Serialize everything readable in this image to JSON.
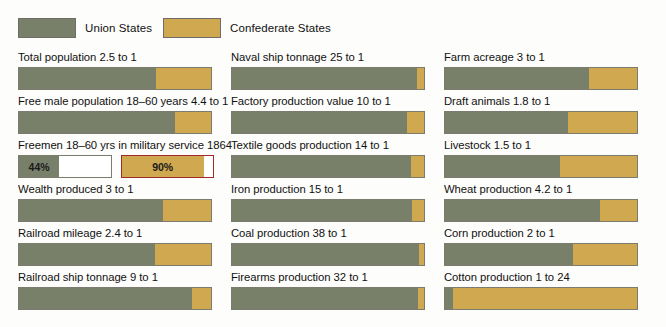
{
  "legend": {
    "union": {
      "label": "Union States",
      "color": "#79806a",
      "icon": "union-swatch"
    },
    "confederate": {
      "label": "Confederate States",
      "color": "#cfa84f",
      "icon": "confederate-swatch"
    }
  },
  "chart_data": {
    "type": "bar",
    "title": "",
    "subtitle": "",
    "xlabel": "",
    "ylabel": "",
    "grid": false,
    "legend_position": "top-left",
    "orientation": "horizontal-stacked",
    "series": [
      {
        "name": "Union States",
        "color": "#79806a"
      },
      {
        "name": "Confederate States",
        "color": "#cfa84f"
      }
    ],
    "columns": [
      {
        "items": [
          {
            "label": "Total population 2.5 to 1",
            "ratio_union": 2.5,
            "ratio_confederate": 1,
            "union_pct": 71.4,
            "confederate_pct": 28.6
          },
          {
            "label": "Free male population 18–60 years 4.4 to 1",
            "ratio_union": 4.4,
            "ratio_confederate": 1,
            "union_pct": 81.5,
            "confederate_pct": 18.5
          },
          {
            "label": "Freemen 18–60 yrs in military service 1864",
            "special": "percent",
            "union_value": "44%",
            "confederate_value": "90%",
            "union_pct": 44,
            "confederate_pct": 90,
            "confederate_outline_color": "#9e2a2a"
          },
          {
            "label": "Wealth produced 3 to 1",
            "ratio_union": 3,
            "ratio_confederate": 1,
            "union_pct": 75.0,
            "confederate_pct": 25.0
          },
          {
            "label": "Railroad mileage 2.4 to 1",
            "ratio_union": 2.4,
            "ratio_confederate": 1,
            "union_pct": 70.6,
            "confederate_pct": 29.4
          },
          {
            "label": "Railroad ship tonnage 9 to 1",
            "ratio_union": 9,
            "ratio_confederate": 1,
            "union_pct": 90.0,
            "confederate_pct": 10.0
          }
        ]
      },
      {
        "items": [
          {
            "label": "Naval ship tonnage 25 to 1",
            "ratio_union": 25,
            "ratio_confederate": 1,
            "union_pct": 96.2,
            "confederate_pct": 3.8
          },
          {
            "label": "Factory production value 10 to 1",
            "ratio_union": 10,
            "ratio_confederate": 1,
            "union_pct": 90.9,
            "confederate_pct": 9.1
          },
          {
            "label": "Textile goods production 14 to 1",
            "ratio_union": 14,
            "ratio_confederate": 1,
            "union_pct": 93.3,
            "confederate_pct": 6.7
          },
          {
            "label": "Iron production 15 to 1",
            "ratio_union": 15,
            "ratio_confederate": 1,
            "union_pct": 93.8,
            "confederate_pct": 6.2
          },
          {
            "label": "Coal production 38 to 1",
            "ratio_union": 38,
            "ratio_confederate": 1,
            "union_pct": 97.4,
            "confederate_pct": 2.6
          },
          {
            "label": "Firearms production 32 to 1",
            "ratio_union": 32,
            "ratio_confederate": 1,
            "union_pct": 97.0,
            "confederate_pct": 3.0
          }
        ]
      },
      {
        "items": [
          {
            "label": "Farm acreage 3 to 1",
            "ratio_union": 3,
            "ratio_confederate": 1,
            "union_pct": 75.0,
            "confederate_pct": 25.0
          },
          {
            "label": "Draft animals 1.8 to 1",
            "ratio_union": 1.8,
            "ratio_confederate": 1,
            "union_pct": 64.3,
            "confederate_pct": 35.7
          },
          {
            "label": "Livestock 1.5 to 1",
            "ratio_union": 1.5,
            "ratio_confederate": 1,
            "union_pct": 60.0,
            "confederate_pct": 40.0
          },
          {
            "label": "Wheat production 4.2 to 1",
            "ratio_union": 4.2,
            "ratio_confederate": 1,
            "union_pct": 80.8,
            "confederate_pct": 19.2
          },
          {
            "label": "Corn production 2 to 1",
            "ratio_union": 2,
            "ratio_confederate": 1,
            "union_pct": 66.7,
            "confederate_pct": 33.3
          },
          {
            "label": "Cotton production 1 to 24",
            "ratio_union": 1,
            "ratio_confederate": 24,
            "union_pct": 4.0,
            "confederate_pct": 96.0
          }
        ]
      }
    ]
  }
}
